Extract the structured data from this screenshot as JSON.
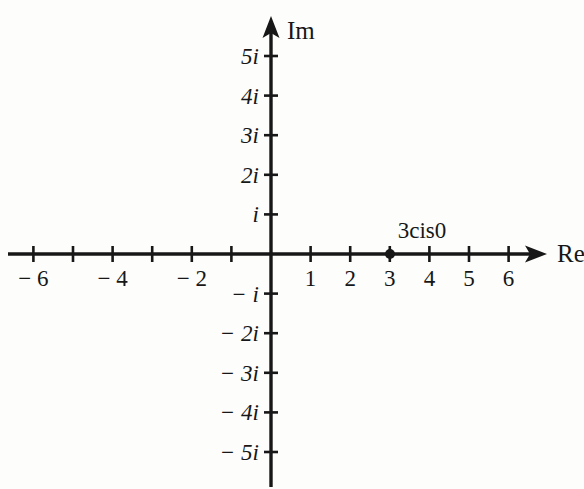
{
  "figure": {
    "kind": "complex-plane-argand-diagram",
    "background_color": "#fdfdfc",
    "ink_color": "#171717"
  },
  "axes": {
    "horizontal": {
      "name": "Re",
      "origin_px": 271,
      "axis_y_px": 254,
      "unit_px": 39.6,
      "start_px": 8,
      "arrow_tip_px": 547,
      "ticks": [
        -6,
        -5,
        -4,
        -3,
        -2,
        -1,
        1,
        2,
        3,
        4,
        5,
        6
      ],
      "tick_labels": [
        {
          "value": -6,
          "text": "− 6"
        },
        {
          "value": -4,
          "text": "− 4"
        },
        {
          "value": -2,
          "text": "− 2"
        },
        {
          "value": 1,
          "text": "1"
        },
        {
          "value": 2,
          "text": "2"
        },
        {
          "value": 3,
          "text": "3"
        },
        {
          "value": 4,
          "text": "4"
        },
        {
          "value": 5,
          "text": "5"
        },
        {
          "value": 6,
          "text": "6"
        }
      ]
    },
    "vertical": {
      "name": "Im",
      "origin_px": 254,
      "axis_x_px": 271,
      "unit_px": 39.6,
      "arrow_tip_px": 16,
      "end_px": 487,
      "ticks": [
        5,
        4,
        3,
        2,
        1,
        -1,
        -2,
        -3,
        -4,
        -5
      ],
      "tick_labels": [
        {
          "value": 5,
          "text": "5i"
        },
        {
          "value": 4,
          "text": "4i"
        },
        {
          "value": 3,
          "text": "3i"
        },
        {
          "value": 2,
          "text": "2i"
        },
        {
          "value": 1,
          "text": "i"
        },
        {
          "value": -1,
          "text": "− i"
        },
        {
          "value": -2,
          "text": "− 2i"
        },
        {
          "value": -3,
          "text": "− 3i"
        },
        {
          "value": -4,
          "text": "− 4i"
        },
        {
          "value": -5,
          "text": "− 5i"
        }
      ]
    }
  },
  "points": [
    {
      "label": "3cis0",
      "re": 3,
      "im": 0,
      "x_px": 390,
      "y_px": 254,
      "radius_px": 5,
      "label_x_px": 422,
      "label_y_px": 219
    }
  ],
  "chart_data": {
    "type": "scatter",
    "title": "",
    "subtitle": "",
    "xlabel": "Re",
    "ylabel": "Im",
    "xlim": [
      -6.7,
      6.9
    ],
    "ylim": [
      -5.9,
      5.9
    ],
    "xticks": [
      -6,
      -5,
      -4,
      -3,
      -2,
      -1,
      1,
      2,
      3,
      4,
      5,
      6
    ],
    "xticklabels": [
      "− 6",
      "",
      "− 4",
      "",
      "− 2",
      "",
      "1",
      "2",
      "3",
      "4",
      "5",
      "6"
    ],
    "yticks": [
      5,
      4,
      3,
      2,
      1,
      -1,
      -2,
      -3,
      -4,
      -5
    ],
    "yticklabels": [
      "5i",
      "4i",
      "3i",
      "2i",
      "i",
      "− i",
      "− 2i",
      "− 3i",
      "− 4i",
      "− 5i"
    ],
    "grid": false,
    "legend": false,
    "series": [
      {
        "name": "3cis0",
        "x": [
          3
        ],
        "y": [
          0
        ],
        "annotations": [
          "3cis0"
        ],
        "marker": "filled-circle",
        "color": "#171717"
      }
    ]
  }
}
